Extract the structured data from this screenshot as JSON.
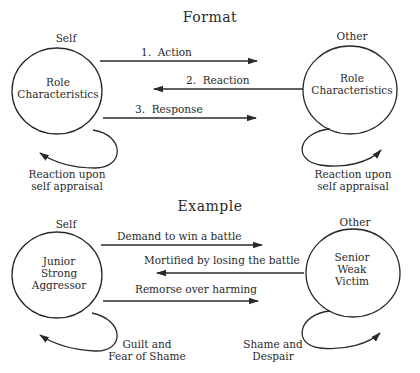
{
  "format": {
    "title": "Format",
    "self": {
      "label": "Self",
      "lines": [
        "Role",
        "Characteristics"
      ],
      "loop_caption": [
        "Reaction upon",
        "self appraisal"
      ]
    },
    "other": {
      "label": "Other",
      "lines": [
        "Role",
        "Characteristics"
      ],
      "loop_caption": [
        "Reaction upon",
        "self appraisal"
      ]
    },
    "arrows": [
      {
        "label": "1.  Action",
        "direction": "self-to-other"
      },
      {
        "label": "2.  Reaction",
        "direction": "other-to-self"
      },
      {
        "label": "3.  Response",
        "direction": "self-to-other"
      }
    ]
  },
  "example": {
    "title": "Example",
    "self": {
      "label": "Self",
      "lines": [
        "Junior",
        "Strong",
        "Aggressor"
      ],
      "loop_caption": [
        "Guilt and",
        "Fear of Shame"
      ]
    },
    "other": {
      "label": "Other",
      "lines": [
        "Senior",
        "Weak",
        "Victim"
      ],
      "loop_caption": [
        "Shame and",
        "Despair"
      ]
    },
    "arrows": [
      {
        "label": "Demand to win a battle",
        "direction": "self-to-other"
      },
      {
        "label": "Mortified by losing the battle",
        "direction": "other-to-self"
      },
      {
        "label": "Remorse over harming",
        "direction": "self-to-other"
      }
    ]
  },
  "colors": {
    "ink": "#2a2a2a",
    "background": "#ffffff"
  }
}
